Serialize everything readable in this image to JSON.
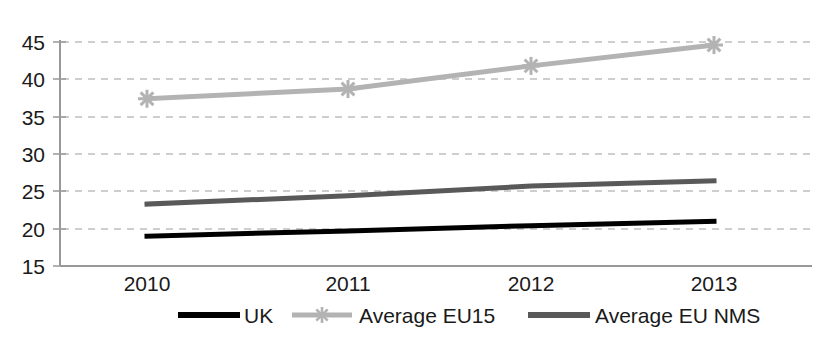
{
  "chart_data": {
    "type": "line",
    "title": "",
    "subtitle": "",
    "xlabel": "",
    "ylabel": "",
    "categories": [
      "2010",
      "2011",
      "2012",
      "2013"
    ],
    "ylim": [
      15,
      45
    ],
    "yticks": [
      15,
      20,
      25,
      30,
      35,
      40,
      45
    ],
    "ytick_labels": [
      "15",
      "20",
      "25",
      "30",
      "35",
      "40",
      "45"
    ],
    "grid": true,
    "grid_style": "dashed-horizontal",
    "legend_position": "bottom",
    "series": [
      {
        "name": "UK",
        "color": "#000000",
        "marker": "none",
        "values": [
          19.0,
          19.7,
          20.4,
          21.0
        ]
      },
      {
        "name": "Average EU15",
        "color": "#b3b3b3",
        "marker": "asterisk",
        "values": [
          37.4,
          38.7,
          41.8,
          44.6
        ]
      },
      {
        "name": "Average EU NMS",
        "color": "#595959",
        "marker": "none",
        "values": [
          23.3,
          24.4,
          25.7,
          26.4
        ]
      }
    ]
  },
  "axes": {
    "axis_line_color": "#808080",
    "gridline_color": "#bfbfbf",
    "tick_label_color": "#1a1a1a"
  },
  "legend": {
    "items": [
      {
        "label": "UK",
        "color": "#000000",
        "marker": "none"
      },
      {
        "label": "Average EU15",
        "color": "#b3b3b3",
        "marker": "asterisk"
      },
      {
        "label": "Average EU NMS",
        "color": "#595959",
        "marker": "none"
      }
    ]
  }
}
